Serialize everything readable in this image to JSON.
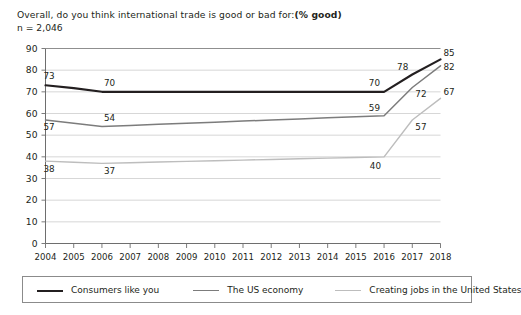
{
  "header": {
    "title_main": "Overall, do you think international trade is good or bad for:",
    "title_emphasis": "(% good)",
    "sample_size": "n = 2,046"
  },
  "legend": {
    "items": [
      {
        "label": "Consumers like you",
        "color": "#231f20",
        "width": 2.1
      },
      {
        "label": "The US economy",
        "color": "#7c7c7c",
        "width": 1.5
      },
      {
        "label": "Creating jobs in the United States",
        "color": "#bdbdbd",
        "width": 1.4
      }
    ]
  },
  "chart_data": {
    "type": "line",
    "subtitle": "n = 2,046",
    "xlabel": "",
    "ylabel": "",
    "ylim": [
      0,
      90
    ],
    "ytick_step": 10,
    "yticks": [
      "0",
      "10",
      "20",
      "30",
      "40",
      "50",
      "60",
      "70",
      "80",
      "90"
    ],
    "grid": true,
    "legend_position": "bottom",
    "x": [
      "2004",
      "2005",
      "2006",
      "2007",
      "2008",
      "2009",
      "2010",
      "2011",
      "2012",
      "2013",
      "2014",
      "2015",
      "2016",
      "2017",
      "2018"
    ],
    "categories": [
      "2004",
      "2005",
      "2006",
      "2007",
      "2008",
      "2009",
      "2010",
      "2011",
      "2012",
      "2013",
      "2014",
      "2015",
      "2016",
      "2017",
      "2018"
    ],
    "series": [
      {
        "name": "Consumers like you",
        "color": "#231f20",
        "points": [
          {
            "x": "2004",
            "y": 73,
            "label": "73"
          },
          {
            "x": "2006",
            "y": 70,
            "label": "70"
          },
          {
            "x": "2016",
            "y": 70,
            "label": "70"
          },
          {
            "x": "2017",
            "y": 78,
            "label": "78"
          },
          {
            "x": "2018",
            "y": 85,
            "label": "85"
          }
        ],
        "values": [
          73,
          71.7,
          70,
          70,
          70,
          70,
          70,
          70,
          70,
          70,
          70,
          70,
          70,
          78,
          85
        ]
      },
      {
        "name": "The US economy",
        "color": "#7c7c7c",
        "points": [
          {
            "x": "2004",
            "y": 57,
            "label": "57"
          },
          {
            "x": "2006",
            "y": 54,
            "label": "54"
          },
          {
            "x": "2016",
            "y": 59,
            "label": "59"
          },
          {
            "x": "2017",
            "y": 72,
            "label": "72"
          },
          {
            "x": "2018",
            "y": 82,
            "label": "82"
          }
        ],
        "values": [
          57,
          55.5,
          54,
          54.5,
          55,
          55.5,
          56,
          56.5,
          57,
          57.5,
          58,
          58.5,
          59,
          72,
          82
        ]
      },
      {
        "name": "Creating jobs in the United States",
        "color": "#bdbdbd",
        "points": [
          {
            "x": "2004",
            "y": 38,
            "label": "38"
          },
          {
            "x": "2006",
            "y": 37,
            "label": "37"
          },
          {
            "x": "2016",
            "y": 40,
            "label": "40"
          },
          {
            "x": "2017",
            "y": 57,
            "label": "57"
          },
          {
            "x": "2018",
            "y": 67,
            "label": "67"
          }
        ],
        "values": [
          38,
          37.5,
          37,
          37.3,
          37.6,
          37.9,
          38.2,
          38.5,
          38.8,
          39.1,
          39.4,
          39.7,
          40,
          57,
          67
        ]
      }
    ]
  }
}
